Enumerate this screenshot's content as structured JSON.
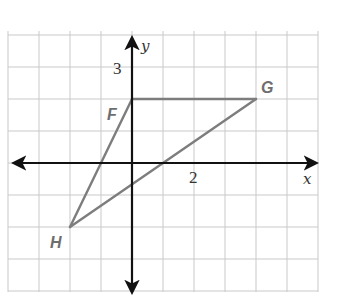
{
  "diagram": {
    "type": "coordinate-plane-triangle",
    "axes": {
      "x_label": "x",
      "y_label": "y",
      "x_range": [
        -4,
        6
      ],
      "y_range": [
        -4,
        4
      ],
      "tick_labels": [
        {
          "axis": "y",
          "value": 3,
          "text": "3"
        },
        {
          "axis": "x",
          "value": 2,
          "text": "2"
        }
      ]
    },
    "grid": {
      "columns": 10,
      "rows": 8,
      "unit_per_cell": 1
    },
    "triangle": {
      "color": "#7d7d7d",
      "vertices": [
        {
          "name": "F",
          "label": "F",
          "x": 0,
          "y": 2
        },
        {
          "name": "G",
          "label": "G",
          "x": 4,
          "y": 2
        },
        {
          "name": "H",
          "label": "H",
          "x": -2,
          "y": -2
        }
      ]
    }
  }
}
